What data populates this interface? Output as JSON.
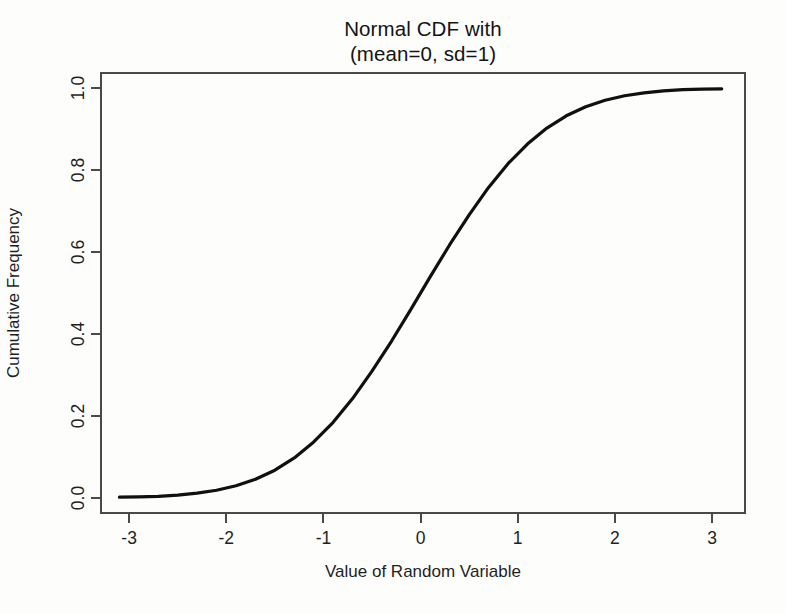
{
  "chart_data": {
    "type": "line",
    "title": "Normal CDF with (mean=0, sd=1)",
    "title_lines": [
      "Normal CDF with",
      "(mean=0, sd=1)"
    ],
    "xlabel": "Value of Random Variable",
    "ylabel": "Cumulative Frequency",
    "xlim": [
      -3.3,
      3.35
    ],
    "ylim": [
      -0.04,
      1.04
    ],
    "grid": false,
    "legend": null,
    "line_color": "#101010",
    "line_width_px": 3,
    "frame_color": "#4a4a4a",
    "background": "#fdfdfc",
    "xticks": [
      -3,
      -2,
      -1,
      0,
      1,
      2,
      3
    ],
    "xtick_labels": [
      "-3",
      "-2",
      "-1",
      "0",
      "1",
      "2",
      "3"
    ],
    "yticks": [
      0.0,
      0.2,
      0.4,
      0.6,
      0.8,
      1.0
    ],
    "ytick_labels": [
      "0.0",
      "0.2",
      "0.4",
      "0.6",
      "0.8",
      "1.0"
    ],
    "series": [
      {
        "name": "Normal CDF (mean=0, sd=1)",
        "x": [
          -3.1,
          -2.9,
          -2.7,
          -2.5,
          -2.3,
          -2.1,
          -1.9,
          -1.7,
          -1.5,
          -1.3,
          -1.1,
          -0.9,
          -0.7,
          -0.5,
          -0.3,
          -0.1,
          0.1,
          0.3,
          0.5,
          0.7,
          0.9,
          1.1,
          1.3,
          1.5,
          1.7,
          1.9,
          2.1,
          2.3,
          2.5,
          2.7,
          2.9,
          3.1
        ],
        "y": [
          0.001,
          0.002,
          0.003,
          0.006,
          0.011,
          0.018,
          0.029,
          0.045,
          0.067,
          0.097,
          0.136,
          0.184,
          0.242,
          0.309,
          0.382,
          0.46,
          0.54,
          0.618,
          0.691,
          0.758,
          0.816,
          0.864,
          0.903,
          0.933,
          0.955,
          0.971,
          0.982,
          0.989,
          0.994,
          0.997,
          0.998,
          0.999
        ]
      }
    ]
  },
  "axes": {
    "x_ticks": [
      {
        "label": "-3",
        "value": -3
      },
      {
        "label": "-2",
        "value": -2
      },
      {
        "label": "-1",
        "value": -1
      },
      {
        "label": "0",
        "value": 0
      },
      {
        "label": "1",
        "value": 1
      },
      {
        "label": "2",
        "value": 2
      },
      {
        "label": "3",
        "value": 3
      }
    ],
    "y_ticks": [
      {
        "label": "0.0",
        "value": 0.0
      },
      {
        "label": "0.2",
        "value": 0.2
      },
      {
        "label": "0.4",
        "value": 0.4
      },
      {
        "label": "0.6",
        "value": 0.6
      },
      {
        "label": "0.8",
        "value": 0.8
      },
      {
        "label": "1.0",
        "value": 1.0
      }
    ]
  }
}
